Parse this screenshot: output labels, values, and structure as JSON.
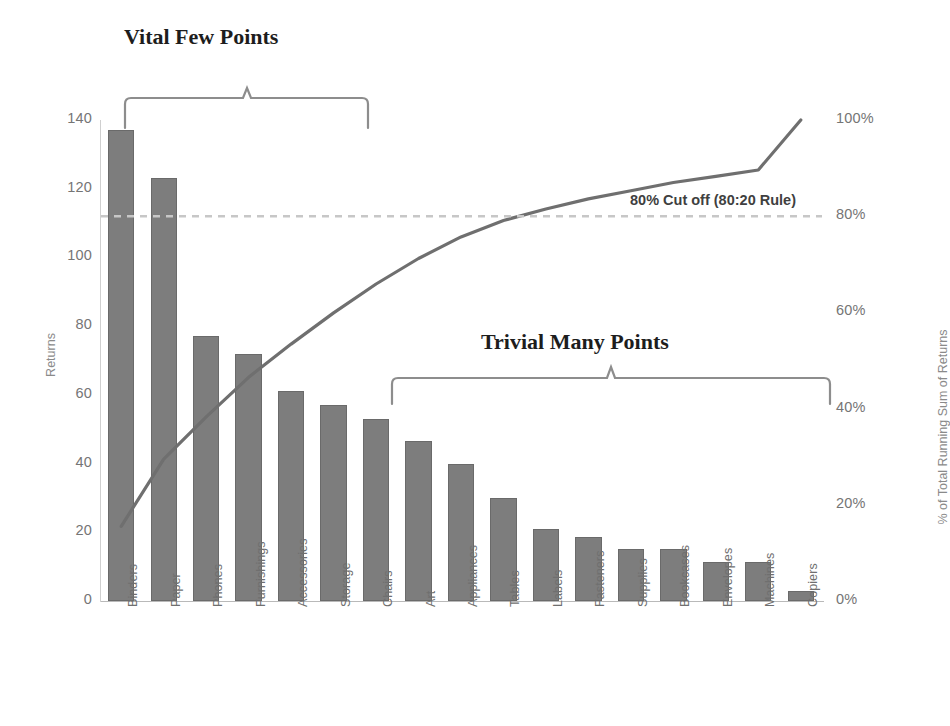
{
  "chart_data": {
    "type": "bar",
    "title": "",
    "subtitle": "",
    "xlabel": "",
    "ylabel": "Returns",
    "y2label": "% of Total Running Sum of Returns",
    "ylim": [
      0,
      140
    ],
    "y2lim": [
      0,
      100
    ],
    "grid": false,
    "legend": "none",
    "categories": [
      "Binders",
      "Paper",
      "Phones",
      "Furnishings",
      "Accessories",
      "Storage",
      "Chairs",
      "Art",
      "Appliances",
      "Tables",
      "Labels",
      "Fasteners",
      "Supplies",
      "Bookcases",
      "Envelopes",
      "Machines",
      "Copiers"
    ],
    "series": [
      {
        "name": "Returns",
        "type": "bar",
        "values": [
          137,
          123,
          77,
          72,
          61,
          57,
          53,
          46.5,
          40,
          30,
          21,
          18.5,
          15,
          15,
          11.5,
          11.5,
          3
        ]
      },
      {
        "name": "% of Total Running Sum of Returns",
        "type": "line",
        "axis": "right",
        "values": [
          15.5,
          29.5,
          38.3,
          46.5,
          53.4,
          59.9,
          65.9,
          71.2,
          75.7,
          79.1,
          81.5,
          83.6,
          85.3,
          87.0,
          88.3,
          89.6,
          100
        ]
      }
    ],
    "y_ticks": [
      0,
      20,
      40,
      60,
      80,
      100,
      120,
      140
    ],
    "y_tick_labels": [
      "0",
      "20",
      "40",
      "60",
      "80",
      "100",
      "120",
      "140"
    ],
    "y2_ticks": [
      0,
      20,
      40,
      60,
      80,
      100
    ],
    "y2_tick_labels": [
      "0%",
      "20%",
      "40%",
      "60%",
      "80%",
      "100%"
    ],
    "reference_line": {
      "value": 80,
      "axis": "right",
      "style": "dashed",
      "label": "80% Cut off (80:20 Rule)"
    },
    "annotations": [
      {
        "text": "Vital Few Points",
        "bracket_from": "Binders",
        "bracket_to": "Chairs"
      },
      {
        "text": "Trivial Many Points",
        "bracket_from": "Art",
        "bracket_to": "Copiers"
      }
    ],
    "colors": {
      "bar": "#7d7d7d",
      "bar_edge": "#6a6a6a",
      "line": "#6f6f6f",
      "reference_line": "#c7c7c7",
      "tick_text": "#757575",
      "annotation_text": "#1d1d1d",
      "cutoff_text": "#3f3f3f"
    }
  },
  "axes": {
    "left": {
      "title": "Returns",
      "ticks": [
        "0",
        "20",
        "40",
        "60",
        "80",
        "100",
        "120",
        "140"
      ]
    },
    "right": {
      "title": "% of Total Running Sum of Returns",
      "ticks": [
        "0%",
        "20%",
        "40%",
        "60%",
        "80%",
        "100%"
      ]
    }
  },
  "annotations": {
    "vital": "Vital Few Points",
    "trivial": "Trivial Many Points",
    "cutoff": "80% Cut off (80:20 Rule)"
  }
}
